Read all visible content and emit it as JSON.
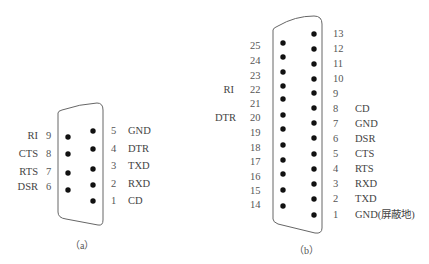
{
  "db9": {
    "caption": "（a）",
    "right_column": [
      {
        "pin": "5",
        "signal": "GND"
      },
      {
        "pin": "4",
        "signal": "DTR"
      },
      {
        "pin": "3",
        "signal": "TXD"
      },
      {
        "pin": "2",
        "signal": "RXD"
      },
      {
        "pin": "1",
        "signal": "CD"
      }
    ],
    "left_column": [
      {
        "pin": "9",
        "signal": "RI"
      },
      {
        "pin": "8",
        "signal": "CTS"
      },
      {
        "pin": "7",
        "signal": "RTS"
      },
      {
        "pin": "6",
        "signal": "DSR"
      }
    ]
  },
  "db25": {
    "caption": "（b）",
    "right_column": [
      {
        "pin": "13",
        "signal": ""
      },
      {
        "pin": "12",
        "signal": ""
      },
      {
        "pin": "11",
        "signal": ""
      },
      {
        "pin": "10",
        "signal": ""
      },
      {
        "pin": "9",
        "signal": ""
      },
      {
        "pin": "8",
        "signal": "CD"
      },
      {
        "pin": "7",
        "signal": "GND"
      },
      {
        "pin": "6",
        "signal": "DSR"
      },
      {
        "pin": "5",
        "signal": "CTS"
      },
      {
        "pin": "4",
        "signal": "RTS"
      },
      {
        "pin": "3",
        "signal": "RXD"
      },
      {
        "pin": "2",
        "signal": "TXD"
      },
      {
        "pin": "1",
        "signal": "GND(屏蔽地)"
      }
    ],
    "left_column": [
      {
        "pin": "25",
        "signal": ""
      },
      {
        "pin": "24",
        "signal": ""
      },
      {
        "pin": "23",
        "signal": ""
      },
      {
        "pin": "22",
        "signal": "RI"
      },
      {
        "pin": "21",
        "signal": ""
      },
      {
        "pin": "20",
        "signal": "DTR"
      },
      {
        "pin": "19",
        "signal": ""
      },
      {
        "pin": "18",
        "signal": ""
      },
      {
        "pin": "17",
        "signal": ""
      },
      {
        "pin": "16",
        "signal": ""
      },
      {
        "pin": "15",
        "signal": ""
      },
      {
        "pin": "14",
        "signal": ""
      }
    ]
  },
  "colors": {
    "outline": "#555555",
    "pin": "#111111",
    "text": "#444444"
  }
}
